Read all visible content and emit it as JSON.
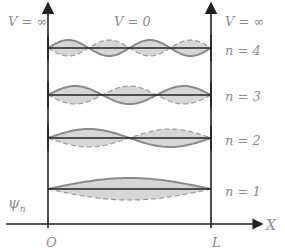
{
  "labels": {
    "v_left": "V = ∞",
    "v_middle": "V = 0",
    "v_right": "V = ∞",
    "psi": "ψ",
    "psi_sub": "n",
    "origin": "O",
    "length": "L",
    "x_axis": "X"
  },
  "levels": [
    {
      "n": 4,
      "label": "n = 4",
      "y": 48,
      "amp": 8
    },
    {
      "n": 3,
      "label": "n = 3",
      "y": 95,
      "amp": 9
    },
    {
      "n": 2,
      "label": "n = 2",
      "y": 138,
      "amp": 9
    },
    {
      "n": 1,
      "label": "n = 1",
      "y": 189,
      "amp": 11
    }
  ],
  "colors": {
    "axis": "#222222",
    "wave": "#8a8a8a",
    "wave_dash": "#9a9a9a",
    "fill": "#d6d6d6",
    "text": "#8c8c8c"
  }
}
